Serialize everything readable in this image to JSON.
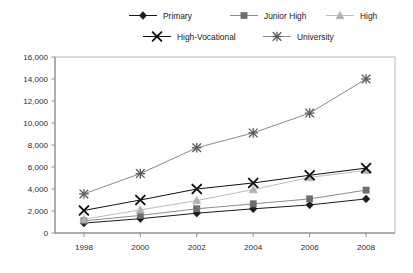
{
  "chart_data": {
    "type": "line",
    "title": "",
    "subtitle": "",
    "xlabel": "",
    "ylabel": "",
    "categories": [
      "1998",
      "2000",
      "2002",
      "2004",
      "2006",
      "2008"
    ],
    "x": [
      1998,
      2000,
      2002,
      2004,
      2006,
      2008
    ],
    "xlim": [
      1997,
      2009
    ],
    "ylim": [
      0,
      16000
    ],
    "ytick_labels": [
      "0",
      "2,000",
      "4,000",
      "6,000",
      "8,000",
      "10,000",
      "12,000",
      "14,000",
      "16,000"
    ],
    "ytick_values": [
      0,
      2000,
      4000,
      6000,
      8000,
      10000,
      12000,
      14000,
      16000
    ],
    "grid": false,
    "legend_position": "top",
    "series": [
      {
        "name": "Primary",
        "marker": "diamond",
        "color": "#1a1a1a",
        "line_color": "#1a1a1a",
        "values": [
          900,
          1300,
          1800,
          2200,
          2550,
          3100
        ]
      },
      {
        "name": "Junior High",
        "marker": "square",
        "color": "#6e6e6e",
        "line_color": "#8c8c8c",
        "values": [
          1100,
          1600,
          2200,
          2650,
          3100,
          3900
        ]
      },
      {
        "name": "High",
        "marker": "triangle",
        "color": "#b0b0b0",
        "line_color": "#bdbdbd",
        "values": [
          1250,
          2100,
          2950,
          3950,
          5050,
          5700
        ]
      },
      {
        "name": "High-Vocational",
        "marker": "x-thick",
        "color": "#111111",
        "line_color": "#111111",
        "values": [
          2050,
          3000,
          4000,
          4550,
          5250,
          5900
        ]
      },
      {
        "name": "University",
        "marker": "asterisk",
        "color": "#5a5a5a",
        "line_color": "#8a8a8a",
        "values": [
          3550,
          5400,
          7750,
          9100,
          10900,
          14000
        ]
      }
    ]
  },
  "legend": {
    "row1": [
      "Primary",
      "Junior High",
      "High"
    ],
    "row2": [
      "High-Vocational",
      "University"
    ]
  },
  "colors": {
    "background": "#ffffff",
    "axis": "#808080",
    "plot_border": "#b8b8b8",
    "text": "#1a1a1a"
  }
}
